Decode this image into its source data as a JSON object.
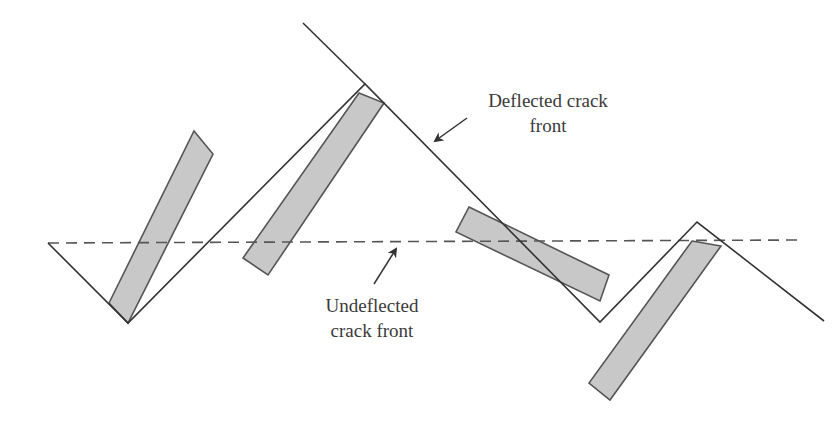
{
  "figure": {
    "colors": {
      "line": "#333333",
      "particle_fill": "#c8c8c8",
      "particle_stroke": "#555555",
      "dashed_line": "#555555",
      "text": "#3a3a3a",
      "background": "#ffffff"
    },
    "labels": {
      "deflected_line1": "Deflected crack",
      "deflected_line2": "front",
      "undeflected_line1": "Undeflected",
      "undeflected_line2": "crack front"
    },
    "undeflected_crack_front": {
      "style": "dashed",
      "x1": 48,
      "y1": 243,
      "x2": 798,
      "y2": 240
    },
    "deflected_crack_front": {
      "style": "solid",
      "points": "48,243 128,323 365,84 600,322 697,222 824,321",
      "upper_segment": "303,23 365,84"
    },
    "particles": [
      {
        "id": 1,
        "points": "194,131 213,154 128,323 109,303"
      },
      {
        "id": 2,
        "points": "359,93 384,103 268,275 243,258"
      },
      {
        "id": 3,
        "points": "469,207 609,275 600,301 456,232"
      },
      {
        "id": 4,
        "points": "692,241 721,246 610,400 589,383"
      }
    ],
    "arrows": [
      {
        "name": "deflected-arrow",
        "from": [
          467,
          118
        ],
        "to": [
          435,
          141
        ]
      },
      {
        "name": "undeflected-arrow",
        "from": [
          374,
          284
        ],
        "to": [
          396,
          249
        ]
      }
    ]
  }
}
